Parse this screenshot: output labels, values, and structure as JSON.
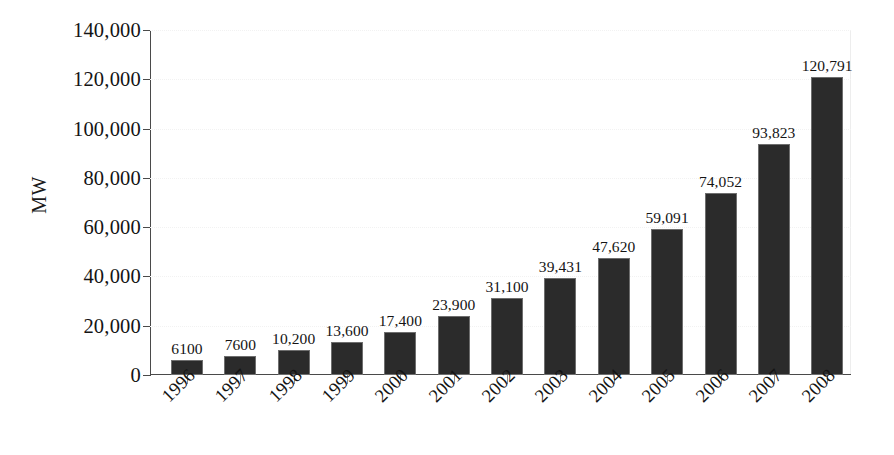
{
  "chart_data": {
    "type": "bar",
    "title": "",
    "subtitle": "",
    "xlabel": "",
    "ylabel": "MW",
    "categories": [
      "1996",
      "1997",
      "1998",
      "1999",
      "2000",
      "2001",
      "2002",
      "2003",
      "2004",
      "2005",
      "2006",
      "2007",
      "2008"
    ],
    "values": [
      6100,
      7600,
      10200,
      13600,
      17400,
      23900,
      31100,
      39431,
      47620,
      59091,
      74052,
      93823,
      120791
    ],
    "value_labels": [
      "6100",
      "7600",
      "10,200",
      "13,600",
      "17,400",
      "23,900",
      "31,100",
      "39,431",
      "47,620",
      "59,091",
      "74,052",
      "93,823",
      "120,791"
    ],
    "ylim": [
      0,
      140000
    ],
    "ytick_values": [
      0,
      20000,
      40000,
      60000,
      80000,
      100000,
      120000,
      140000
    ],
    "ytick_labels": [
      "0",
      "20,000",
      "40,000",
      "60,000",
      "80,000",
      "100,000",
      "120,000",
      "140,000"
    ],
    "grid": false,
    "legend": null,
    "legend_position": "none",
    "bar_color": "#2b2b2b",
    "bar_edge_color": "#6e6e6e",
    "background_color": "#ffffff",
    "axis_color": "#4a4a4a",
    "text_color": "#141414",
    "xtick_label_rotation": -45
  }
}
